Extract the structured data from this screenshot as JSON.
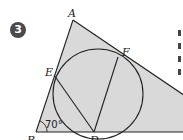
{
  "exercise": {
    "number": "3"
  },
  "figure": {
    "type": "triangle with inscribed circle",
    "fill_color": "#d9d9d9",
    "stroke_color": "#222222",
    "points": {
      "A": {
        "label": "A"
      },
      "B": {
        "label": "B"
      },
      "C": {
        "label": "C"
      },
      "D": {
        "label": "D"
      },
      "E": {
        "label": "E"
      },
      "F": {
        "label": "F"
      }
    },
    "angle_B": {
      "label": "70°"
    },
    "segments": [
      "ED",
      "FD"
    ]
  }
}
